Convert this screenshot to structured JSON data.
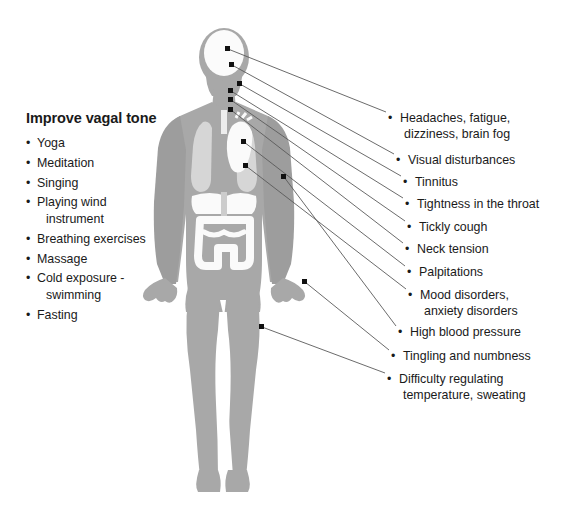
{
  "colors": {
    "background": "#ffffff",
    "body_silhouette": "#a8a8a8",
    "body_shadow": "#9a9a9a",
    "organ_light": "#d4d4d4",
    "organ_white": "#f5f5f5",
    "text": "#1a1a1a",
    "leader_line": "#5a5a5a",
    "anchor_dot": "#111111"
  },
  "left_panel": {
    "title": "Improve vagal tone",
    "bullet_glyph": "•",
    "items": [
      {
        "line1": "Yoga",
        "line2": ""
      },
      {
        "line1": "Meditation",
        "line2": ""
      },
      {
        "line1": "Singing",
        "line2": ""
      },
      {
        "line1": "Playing wind",
        "line2": "instrument"
      },
      {
        "line1": "Breathing exercises",
        "line2": ""
      },
      {
        "line1": "Massage",
        "line2": ""
      },
      {
        "line1": "Cold exposure -",
        "line2": "swimming"
      },
      {
        "line1": "Fasting",
        "line2": ""
      }
    ]
  },
  "symptoms": {
    "bullet_glyph": "•",
    "items": [
      {
        "name": "headaches-fatigue-dizziness-brain-fog",
        "line1": "Headaches, fatigue,",
        "line2": "dizziness, brain fog",
        "label_x": 388,
        "label_y": 110,
        "anchor_x": 228,
        "anchor_y": 49
      },
      {
        "name": "visual-disturbances",
        "line1": "Visual disturbances",
        "line2": "",
        "label_x": 396,
        "label_y": 152,
        "anchor_x": 232,
        "anchor_y": 65
      },
      {
        "name": "tinnitus",
        "line1": "Tinnitus",
        "line2": "",
        "label_x": 403,
        "label_y": 174,
        "anchor_x": 240,
        "anchor_y": 84
      },
      {
        "name": "tightness-in-the-throat",
        "line1": "Tightness in the throat",
        "line2": "",
        "label_x": 405,
        "label_y": 196,
        "anchor_x": 231,
        "anchor_y": 91
      },
      {
        "name": "tickly-cough",
        "line1": "Tickly cough",
        "line2": "",
        "label_x": 407,
        "label_y": 219,
        "anchor_x": 231,
        "anchor_y": 100
      },
      {
        "name": "neck-tension",
        "line1": "Neck tension",
        "line2": "",
        "label_x": 405,
        "label_y": 241,
        "anchor_x": 231,
        "anchor_y": 110
      },
      {
        "name": "palpitations",
        "line1": "Palpitations",
        "line2": "",
        "label_x": 407,
        "label_y": 264,
        "anchor_x": 244,
        "anchor_y": 142
      },
      {
        "name": "mood-disorders-anxiety-disorders",
        "line1": "Mood disorders,",
        "line2": "anxiety disorders",
        "label_x": 408,
        "label_y": 287,
        "anchor_x": 246,
        "anchor_y": 166
      },
      {
        "name": "high-blood-pressure",
        "line1": "High blood pressure",
        "line2": "",
        "label_x": 398,
        "label_y": 324,
        "anchor_x": 284,
        "anchor_y": 177
      },
      {
        "name": "tingling-and-numbness",
        "line1": "Tingling and numbness",
        "line2": "",
        "label_x": 391,
        "label_y": 348,
        "anchor_x": 305,
        "anchor_y": 282
      },
      {
        "name": "difficulty-regulating-temperature-sweating",
        "line1": "Difficulty regulating",
        "line2": "temperature, sweating",
        "label_x": 387,
        "label_y": 371,
        "anchor_x": 262,
        "anchor_y": 327
      }
    ]
  },
  "figure": {
    "name": "human-body-silhouette-with-organs",
    "organs": [
      "lungs",
      "heart",
      "liver",
      "stomach",
      "intestines",
      "brain-skull"
    ]
  }
}
